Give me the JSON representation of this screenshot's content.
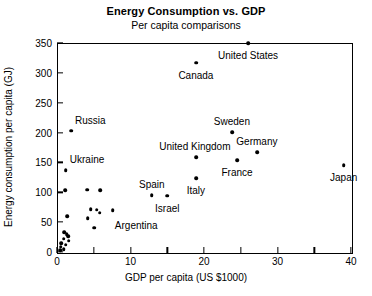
{
  "chart_data": {
    "type": "scatter",
    "title": "Energy Consumption vs. GDP",
    "subtitle": "Per capita comparisons",
    "xlabel": "GDP per capita (US $1000)",
    "ylabel": "Energy consumption per capita (GJ)",
    "xlim": [
      0,
      40
    ],
    "ylim": [
      0,
      350
    ],
    "xticks": [
      0,
      10,
      20,
      30,
      40
    ],
    "xticks_minor": [
      5,
      15,
      25,
      35
    ],
    "yticks": [
      0,
      50,
      100,
      150,
      200,
      250,
      300,
      350
    ],
    "grid": false,
    "legend": null,
    "marker": "filled-circle",
    "marker_color": "#000000",
    "points": [
      {
        "label": "United States",
        "x": 26.0,
        "y": 350,
        "label_dx": 0,
        "label_dy": 13,
        "label_align": "center"
      },
      {
        "label": "Canada",
        "x": 18.9,
        "y": 317,
        "label_dx": 0,
        "label_dy": 13,
        "label_align": "center"
      },
      {
        "label": "Sweden",
        "x": 23.8,
        "y": 201,
        "label_dx": 0,
        "label_dy": -10,
        "label_align": "center"
      },
      {
        "label": "Germany",
        "x": 27.2,
        "y": 167,
        "label_dx": 0,
        "label_dy": -10,
        "label_align": "center"
      },
      {
        "label": "France",
        "x": 24.5,
        "y": 154,
        "label_dx": 0,
        "label_dy": 13,
        "label_align": "center"
      },
      {
        "label": "United Kingdom",
        "x": 18.9,
        "y": 159,
        "label_dx": -1,
        "label_dy": -10,
        "label_align": "center"
      },
      {
        "label": "Japan",
        "x": 39.0,
        "y": 145,
        "label_dx": 0,
        "label_dy": 13,
        "label_align": "center"
      },
      {
        "label": "Italy",
        "x": 18.9,
        "y": 124,
        "label_dx": 0,
        "label_dy": 13,
        "label_align": "center"
      },
      {
        "label": "Spain",
        "x": 12.9,
        "y": 95,
        "label_dx": 0,
        "label_dy": -10,
        "label_align": "center"
      },
      {
        "label": "Israel",
        "x": 15.0,
        "y": 94,
        "label_dx": 0,
        "label_dy": 13,
        "label_align": "center"
      },
      {
        "label": "Russia",
        "x": 1.9,
        "y": 203,
        "label_dx": 4,
        "label_dy": -10,
        "label_align": "left"
      },
      {
        "label": "Ukraine",
        "x": 1.2,
        "y": 137,
        "label_dx": 4,
        "label_dy": -10,
        "label_align": "left"
      },
      {
        "label": "Argentina",
        "x": 7.6,
        "y": 70,
        "label_dx": 2,
        "label_dy": 16,
        "label_align": "left"
      },
      {
        "label": "",
        "x": 1.1,
        "y": 103
      },
      {
        "label": "",
        "x": 4.1,
        "y": 104
      },
      {
        "label": "",
        "x": 5.9,
        "y": 103
      },
      {
        "label": "",
        "x": 4.6,
        "y": 72
      },
      {
        "label": "",
        "x": 5.4,
        "y": 71
      },
      {
        "label": "",
        "x": 5.8,
        "y": 66
      },
      {
        "label": "",
        "x": 4.2,
        "y": 57
      },
      {
        "label": "",
        "x": 1.4,
        "y": 60
      },
      {
        "label": "",
        "x": 5.1,
        "y": 41
      },
      {
        "label": "",
        "x": 1.0,
        "y": 33
      },
      {
        "label": "",
        "x": 1.3,
        "y": 30
      },
      {
        "label": "",
        "x": 1.5,
        "y": 26
      },
      {
        "label": "",
        "x": 0.9,
        "y": 22
      },
      {
        "label": "",
        "x": 1.6,
        "y": 19
      },
      {
        "label": "",
        "x": 0.6,
        "y": 15
      },
      {
        "label": "",
        "x": 1.2,
        "y": 12
      },
      {
        "label": "",
        "x": 0.5,
        "y": 9
      },
      {
        "label": "",
        "x": 0.9,
        "y": 5
      },
      {
        "label": "",
        "x": 0.4,
        "y": 3
      }
    ]
  }
}
